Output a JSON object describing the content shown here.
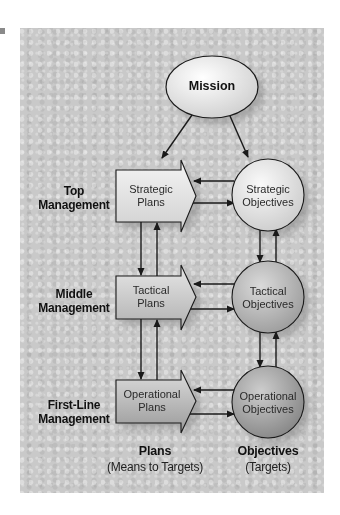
{
  "diagram": {
    "type": "planning-hierarchy",
    "top_node": {
      "label": "Mission"
    },
    "levels": [
      {
        "management": "Top Management",
        "management_lines": [
          "Top",
          "Management"
        ],
        "plan": "Strategic Plans",
        "plan_lines": [
          "Strategic",
          "Plans"
        ],
        "objective": "Strategic Objectives",
        "objective_lines": [
          "Strategic",
          "Objectives"
        ]
      },
      {
        "management": "Middle Management",
        "management_lines": [
          "Middle",
          "Management"
        ],
        "plan": "Tactical Plans",
        "plan_lines": [
          "Tactical",
          "Plans"
        ],
        "objective": "Tactical Objectives",
        "objective_lines": [
          "Tactical",
          "Objectives"
        ]
      },
      {
        "management": "First-Line Management",
        "management_lines": [
          "First-Line",
          "Management"
        ],
        "plan": "Operational Plans",
        "plan_lines": [
          "Operational",
          "Plans"
        ],
        "objective": "Operational Objectives",
        "objective_lines": [
          "Operational",
          "Objectives"
        ]
      }
    ],
    "columns": {
      "plans": {
        "title": "Plans",
        "subtitle": "(Means to Targets)"
      },
      "objectives": {
        "title": "Objectives",
        "subtitle": "(Targets)"
      }
    },
    "edges": [
      {
        "from": "Mission",
        "to": "Strategic Plans"
      },
      {
        "from": "Mission",
        "to": "Strategic Objectives"
      },
      {
        "from": "Strategic Objectives",
        "to": "Strategic Plans"
      },
      {
        "from": "Strategic Plans",
        "to": "Strategic Objectives"
      },
      {
        "from": "Strategic Plans",
        "to": "Tactical Plans"
      },
      {
        "from": "Tactical Plans",
        "to": "Strategic Plans"
      },
      {
        "from": "Strategic Objectives",
        "to": "Tactical Objectives"
      },
      {
        "from": "Tactical Objectives",
        "to": "Strategic Objectives"
      },
      {
        "from": "Tactical Objectives",
        "to": "Tactical Plans"
      },
      {
        "from": "Tactical Plans",
        "to": "Tactical Objectives"
      },
      {
        "from": "Tactical Plans",
        "to": "Operational Plans"
      },
      {
        "from": "Operational Plans",
        "to": "Tactical Plans"
      },
      {
        "from": "Tactical Objectives",
        "to": "Operational Objectives"
      },
      {
        "from": "Operational Objectives",
        "to": "Tactical Objectives"
      },
      {
        "from": "Operational Objectives",
        "to": "Operational Plans"
      },
      {
        "from": "Operational Plans",
        "to": "Operational Objectives"
      }
    ],
    "colors": {
      "panel_background": "#c9c9c9",
      "line": "#1a1a1a",
      "mission_fill": "#e8e8e8",
      "strategic_fill": "#e6e6e6",
      "tactical_fill": "#b5b5b5",
      "operational_fill": "#9f9f9f"
    }
  }
}
